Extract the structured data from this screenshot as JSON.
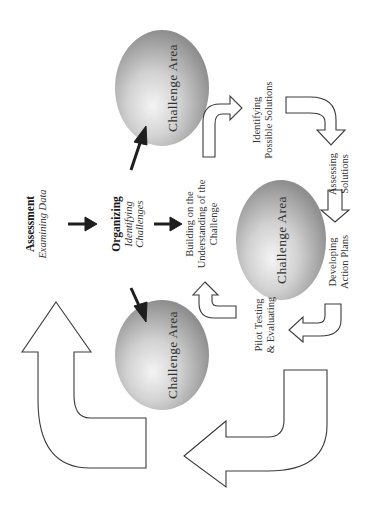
{
  "diagram": {
    "orientation": "rotated-90-ccw",
    "assessment": {
      "title": "Assessment",
      "subtitle": "Examining Data"
    },
    "organizing": {
      "title": "Organizing",
      "subtitle_line1": "Identifying",
      "subtitle_line2": "Challenges"
    },
    "spheres": [
      {
        "label": "Challenge Area",
        "position": "top"
      },
      {
        "label": "Challenge Area",
        "position": "center"
      },
      {
        "label": "Challenge Area",
        "position": "bottom"
      }
    ],
    "steps": {
      "building": {
        "line1": "Building on the",
        "line2": "Understanding of the",
        "line3": "Challenge"
      },
      "identifying": {
        "line1": "Identifying",
        "line2": "Possible Solutions"
      },
      "assessing": {
        "line1": "Assessing",
        "line2": "Solutions"
      },
      "developing": {
        "line1": "Developing",
        "line2": "Action Plans"
      },
      "pilot": {
        "line1": "Pilot Testing",
        "line2": "& Evaluating"
      }
    },
    "colors": {
      "sphere_light": "#f2f2f2",
      "sphere_mid": "#bdbdbd",
      "sphere_dark": "#8a8a8a",
      "arrow_outline": "#3a3a3a",
      "solid_arrow": "#1e1e1e",
      "background": "#ffffff"
    }
  }
}
